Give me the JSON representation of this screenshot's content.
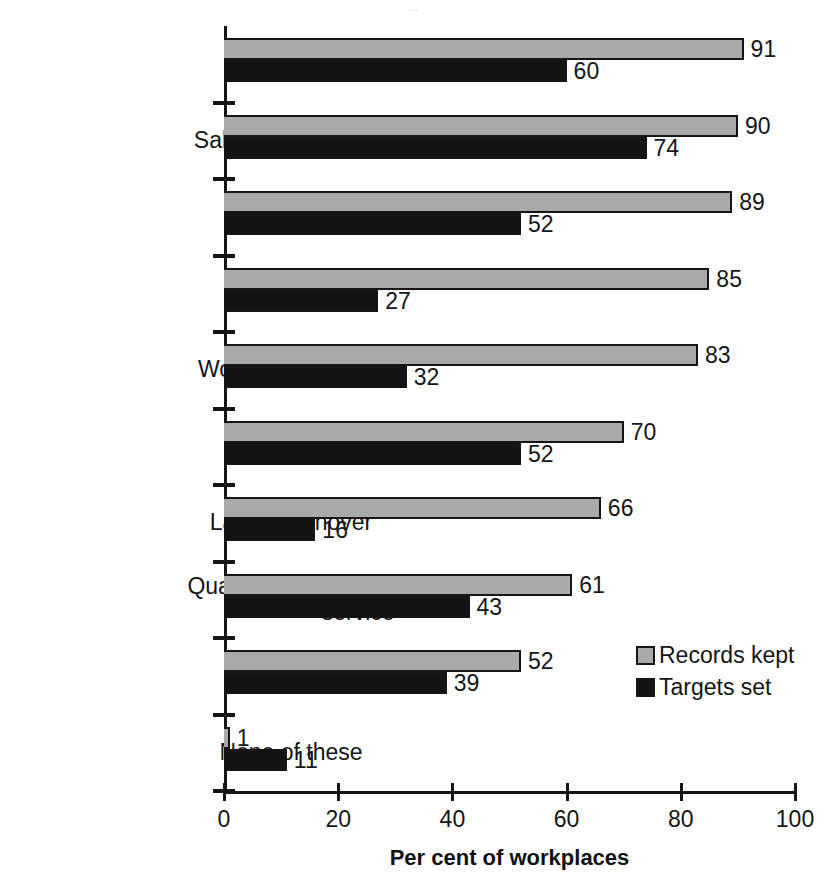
{
  "page": {
    "bleed_text": "..."
  },
  "chart_data": {
    "type": "bar",
    "orientation": "horizontal",
    "title": "",
    "xlabel": "Per cent of workplaces",
    "ylabel": "",
    "xlim": [
      0,
      100
    ],
    "xticks": [
      0,
      20,
      40,
      60,
      80,
      100
    ],
    "xtick_labels": [
      "0",
      "20",
      "40",
      "60",
      "80",
      "100"
    ],
    "grid": false,
    "legend_position": "right-inside",
    "categories": [
      "Costs",
      "Sales/Fees/Budget",
      "Labour costs",
      "Absenteeism",
      "Workforce training",
      "Profits",
      "Labour turnover",
      "Quality of product or service",
      "Productivity",
      "None of these"
    ],
    "series": [
      {
        "name": "Records kept",
        "color": "#a9a9a9",
        "values": [
          91,
          90,
          89,
          85,
          83,
          70,
          66,
          61,
          52,
          1
        ]
      },
      {
        "name": "Targets set",
        "color": "#131313",
        "values": [
          60,
          74,
          52,
          27,
          32,
          52,
          16,
          43,
          39,
          11
        ]
      }
    ]
  },
  "legend": {
    "items": [
      {
        "label": "Records kept",
        "color": "#a9a9a9"
      },
      {
        "label": "Targets set",
        "color": "#131313"
      }
    ]
  }
}
